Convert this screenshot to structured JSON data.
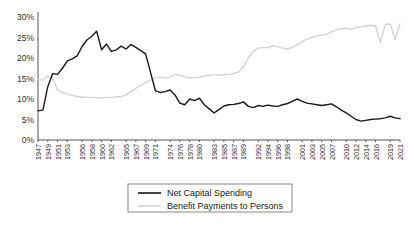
{
  "chart_data": {
    "type": "line",
    "title": "",
    "xlabel": "",
    "ylabel": "",
    "ylim": [
      0,
      30
    ],
    "yticks": [
      0,
      5,
      10,
      15,
      20,
      25,
      30
    ],
    "ytick_labels": [
      "0%",
      "5%",
      "10%",
      "15%",
      "20%",
      "25%",
      "30%"
    ],
    "grid": false,
    "legend_position": "bottom-center",
    "xlim": [
      1947,
      2021
    ],
    "xtick_labels": [
      "1947",
      "1949",
      "1951",
      "1953",
      "1956",
      "1958",
      "1960",
      "1962",
      "1965",
      "1967",
      "1969",
      "1971",
      "1974",
      "1976",
      "1978",
      "1980",
      "1983",
      "1985",
      "1987",
      "1989",
      "1992",
      "1994",
      "1996",
      "1998",
      "2001",
      "2003",
      "2005",
      "2007",
      "2010",
      "2012",
      "2014",
      "2016",
      "2019",
      "2021"
    ],
    "x": [
      1947,
      1948,
      1949,
      1950,
      1951,
      1952,
      1953,
      1954,
      1955,
      1956,
      1957,
      1958,
      1959,
      1960,
      1961,
      1962,
      1963,
      1964,
      1965,
      1966,
      1967,
      1968,
      1969,
      1970,
      1971,
      1972,
      1973,
      1974,
      1975,
      1976,
      1977,
      1978,
      1979,
      1980,
      1981,
      1982,
      1983,
      1984,
      1985,
      1986,
      1987,
      1988,
      1989,
      1990,
      1991,
      1992,
      1993,
      1994,
      1995,
      1996,
      1997,
      1998,
      1999,
      2000,
      2001,
      2002,
      2003,
      2004,
      2005,
      2006,
      2007,
      2008,
      2009,
      2010,
      2011,
      2012,
      2013,
      2014,
      2015,
      2016,
      2017,
      2018,
      2019,
      2020,
      2021
    ],
    "series": [
      {
        "name": "Net Capital Spending",
        "color": "#1a1a1a",
        "values": [
          7.1,
          7.3,
          13.0,
          16.2,
          16.0,
          17.5,
          19.3,
          19.8,
          20.5,
          22.8,
          24.4,
          25.3,
          26.5,
          22.0,
          23.4,
          21.6,
          22.0,
          22.9,
          22.2,
          23.3,
          22.6,
          21.8,
          21.0,
          16.5,
          12.0,
          11.6,
          11.8,
          12.2,
          11.0,
          9.0,
          8.6,
          10.0,
          9.6,
          10.2,
          8.6,
          7.6,
          6.6,
          7.4,
          8.3,
          8.6,
          8.7,
          8.9,
          9.3,
          8.2,
          7.9,
          8.4,
          8.2,
          8.5,
          8.3,
          8.2,
          8.6,
          8.9,
          9.4,
          10.0,
          9.4,
          9.0,
          8.8,
          8.6,
          8.4,
          8.6,
          8.8,
          8.1,
          7.3,
          6.6,
          5.8,
          5.0,
          4.6,
          4.8,
          5.0,
          5.1,
          5.2,
          5.4,
          5.8,
          5.4,
          5.2
        ]
      },
      {
        "name": "Benefit Payments to Persons",
        "color": "#d4d4d4",
        "values": [
          14.8,
          14.6,
          15.6,
          15.2,
          12.2,
          11.6,
          11.2,
          10.9,
          10.6,
          10.5,
          10.4,
          10.4,
          10.3,
          10.3,
          10.4,
          10.4,
          10.5,
          10.6,
          11.0,
          11.8,
          12.6,
          13.3,
          14.0,
          14.6,
          15.2,
          15.4,
          15.1,
          15.3,
          16.0,
          15.8,
          15.4,
          15.2,
          15.2,
          15.3,
          15.6,
          15.8,
          16.0,
          15.8,
          15.9,
          16.0,
          16.2,
          16.6,
          17.8,
          20.0,
          21.6,
          22.4,
          22.6,
          22.5,
          23.0,
          22.8,
          22.4,
          22.2,
          22.6,
          23.2,
          24.0,
          24.6,
          25.0,
          25.4,
          25.6,
          25.8,
          26.4,
          26.8,
          27.2,
          27.2,
          27.0,
          27.4,
          27.6,
          27.8,
          28.0,
          27.8,
          23.8,
          28.2,
          28.3,
          24.5,
          28.3
        ]
      }
    ]
  },
  "legend": {
    "items": [
      {
        "label": "Net Capital Spending",
        "color": "#1a1a1a"
      },
      {
        "label": "Benefit Payments to Persons",
        "color": "#d4d4d4"
      }
    ]
  }
}
